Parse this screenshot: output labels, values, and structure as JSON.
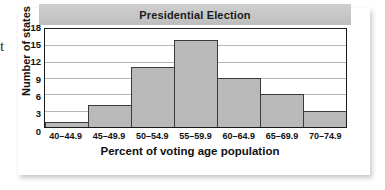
{
  "edge_fragment": "t",
  "chart_data": {
    "type": "bar",
    "title": "Presidential Election",
    "xlabel": "Percent of voting age population",
    "ylabel": "Number of states",
    "categories": [
      "40–44.9",
      "45–49.9",
      "50–54.9",
      "55–59.9",
      "60–64.9",
      "65–69.9",
      "70–74.9"
    ],
    "values": [
      1,
      4,
      11,
      16,
      9,
      6,
      3
    ],
    "ylim": [
      0,
      18
    ],
    "yticks": [
      18,
      15,
      12,
      9,
      6,
      3,
      0
    ],
    "grid": true,
    "legend": "none",
    "colors": {
      "bar_fill": "#b9b9b9",
      "bar_outline": "#3a3a3a",
      "title_band": "#c6c6c6",
      "gridline": "#b6b6b6",
      "frame": "#1a1a1a",
      "text": "#111111",
      "panel": "#ffffff"
    }
  }
}
